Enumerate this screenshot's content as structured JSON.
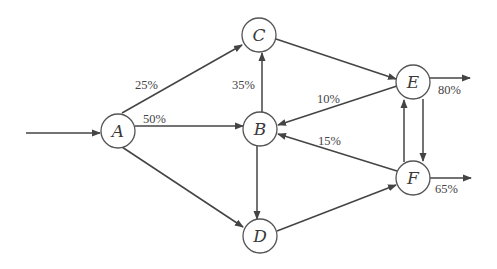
{
  "diagram": {
    "type": "flow-network",
    "nodes": [
      {
        "id": "A",
        "label": "A",
        "x": 118,
        "y": 131
      },
      {
        "id": "B",
        "label": "B",
        "x": 260,
        "y": 129
      },
      {
        "id": "C",
        "label": "C",
        "x": 259,
        "y": 35
      },
      {
        "id": "D",
        "label": "D",
        "x": 260,
        "y": 236
      },
      {
        "id": "E",
        "label": "E",
        "x": 413,
        "y": 82
      },
      {
        "id": "F",
        "label": "F",
        "x": 413,
        "y": 178
      }
    ],
    "edges": [
      {
        "from": "input",
        "to": "A",
        "label": ""
      },
      {
        "from": "A",
        "to": "C",
        "label": "25%"
      },
      {
        "from": "A",
        "to": "B",
        "label": "50%"
      },
      {
        "from": "A",
        "to": "D",
        "label": ""
      },
      {
        "from": "B",
        "to": "C",
        "label": "35%"
      },
      {
        "from": "B",
        "to": "D",
        "label": ""
      },
      {
        "from": "C",
        "to": "E",
        "label": ""
      },
      {
        "from": "E",
        "to": "B",
        "label": "10%"
      },
      {
        "from": "F",
        "to": "B",
        "label": "15%"
      },
      {
        "from": "D",
        "to": "F",
        "label": ""
      },
      {
        "from": "E",
        "to": "F",
        "label": ""
      },
      {
        "from": "F",
        "to": "E",
        "label": ""
      },
      {
        "from": "E",
        "to": "output",
        "label": "80%"
      },
      {
        "from": "F",
        "to": "output",
        "label": "65%"
      }
    ],
    "labels": {
      "a_c": "25%",
      "a_b": "50%",
      "b_c": "35%",
      "e_b": "10%",
      "f_b": "15%",
      "e_out": "80%",
      "f_out": "65%"
    },
    "node_labels": {
      "A": "A",
      "B": "B",
      "C": "C",
      "D": "D",
      "E": "E",
      "F": "F"
    },
    "colors": {
      "stroke": "#444444",
      "text": "#3a3a3a",
      "background": "#ffffff"
    }
  }
}
